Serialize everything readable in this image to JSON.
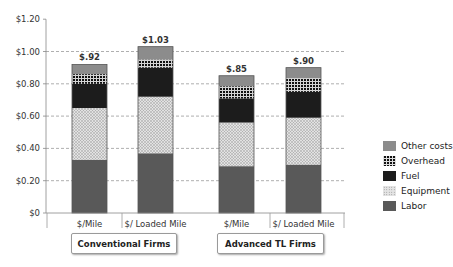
{
  "chart_data": {
    "type": "bar",
    "stacked": true,
    "title": "",
    "xlabel": "",
    "ylabel": "",
    "ylim": [
      0,
      1.2
    ],
    "yticks": [
      "$0",
      "$0.20",
      "$0.40",
      "$0.60",
      "$0.80",
      "$1.00",
      "$1.20"
    ],
    "grid": true,
    "legend_position": "right",
    "categories": [
      "$/Mile",
      "$/ Loaded Mile",
      "$/Mile",
      "$/ Loaded Mile"
    ],
    "groups": [
      {
        "label": "Conventional Firms",
        "categories": [
          "$/Mile",
          "$/ Loaded Mile"
        ]
      },
      {
        "label": "Advanced TL Firms",
        "categories": [
          "$/Mile",
          "$/ Loaded Mile"
        ]
      }
    ],
    "totals": [
      0.92,
      1.03,
      0.85,
      0.9
    ],
    "total_labels": [
      "$.92",
      "$1.03",
      "$.85",
      "$.90"
    ],
    "series": [
      {
        "name": "Labor",
        "color": "#595959",
        "pattern": "solid",
        "values": [
          0.33,
          0.37,
          0.29,
          0.3
        ]
      },
      {
        "name": "Equipment",
        "color": "#d8d8d8",
        "pattern": "dots",
        "values": [
          0.32,
          0.35,
          0.27,
          0.29
        ]
      },
      {
        "name": "Fuel",
        "color": "#1c1c1c",
        "pattern": "solid",
        "values": [
          0.15,
          0.18,
          0.15,
          0.16
        ]
      },
      {
        "name": "Overhead",
        "color": "#111111",
        "pattern": "grid",
        "values": [
          0.06,
          0.05,
          0.075,
          0.085
        ]
      },
      {
        "name": "Other costs",
        "color": "#8c8c8c",
        "pattern": "solid",
        "values": [
          0.06,
          0.08,
          0.065,
          0.065
        ]
      }
    ]
  },
  "legend": {
    "items": [
      {
        "label": "Other costs",
        "key": "other"
      },
      {
        "label": "Overhead",
        "key": "overhead"
      },
      {
        "label": "Fuel",
        "key": "fuel"
      },
      {
        "label": "Equipment",
        "key": "equipment"
      },
      {
        "label": "Labor",
        "key": "labor"
      }
    ]
  },
  "groups": {
    "conventional": "Conventional Firms",
    "advanced": "Advanced TL Firms"
  }
}
